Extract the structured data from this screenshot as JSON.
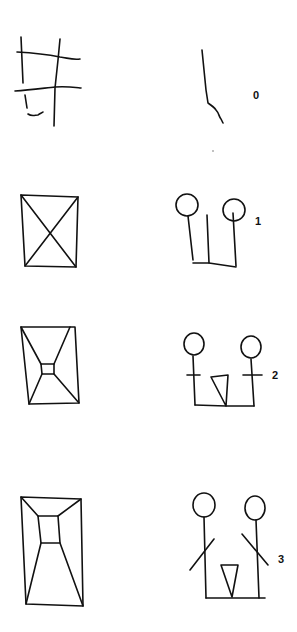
{
  "diagram": {
    "background": "#ffffff",
    "ink_color": "#111111",
    "rows": [
      {
        "index": 0,
        "label": "0",
        "left": "grid-sketch",
        "right": "single-wavy-line"
      },
      {
        "index": 1,
        "label": "1",
        "left": "rectangle-with-x-diagonals",
        "right": "two-figures-heads-and-lines"
      },
      {
        "index": 2,
        "label": "2",
        "left": "rectangle-with-small-center-square",
        "right": "two-figures-with-crossbars-and-triangle"
      },
      {
        "index": 3,
        "label": "3",
        "left": "rectangle-with-perspective-corridor",
        "right": "two-stick-figures-with-arms-and-triangle"
      }
    ]
  }
}
